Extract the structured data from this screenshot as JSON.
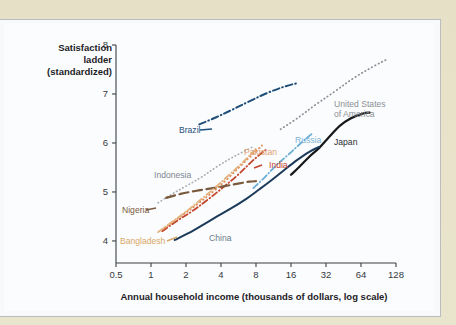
{
  "figure": {
    "background_color": "#fbfcfd",
    "paper_color": "#e9e4cc",
    "y_axis_label_lines": [
      "Satisfaction",
      "ladder",
      "(standardized)"
    ],
    "x_axis_title": "Annual household income (thousands of dollars, log scale)"
  },
  "chart_data": {
    "type": "line",
    "title": "",
    "subtitle": "",
    "xlabel": "Annual household income (thousands of dollars, log scale)",
    "ylabel": "Satisfaction ladder (standardized)",
    "x_scale": "log2",
    "x_ticks": [
      0.5,
      1,
      2,
      4,
      8,
      16,
      32,
      64,
      128
    ],
    "x_tick_labels": [
      "0.5",
      "1",
      "2",
      "4",
      "8",
      "16",
      "32",
      "64",
      "128"
    ],
    "y_ticks": [
      4,
      5,
      6,
      7,
      8
    ],
    "y_tick_labels": [
      "4",
      "5",
      "6",
      "7",
      "8"
    ],
    "xlim": [
      0.5,
      128
    ],
    "ylim": [
      3.55,
      8.0
    ],
    "grid": false,
    "legend": "inline-labels",
    "series": [
      {
        "name": "Brazil",
        "color": "#1f4e79",
        "dash": "dash-dot",
        "width": 2.0,
        "label_color": "#1f4e79",
        "label_x": 175,
        "label_y": 110,
        "label_anchor": "start",
        "points": [
          [
            2.6,
            6.38
          ],
          [
            3.6,
            6.52
          ],
          [
            5.0,
            6.68
          ],
          [
            7.0,
            6.85
          ],
          [
            10.0,
            7.02
          ],
          [
            14.0,
            7.15
          ],
          [
            18.0,
            7.22
          ]
        ]
      },
      {
        "name": "United States of America",
        "color": "#8d9096",
        "dash": "dotted",
        "width": 1.7,
        "label_color": "#8d9096",
        "label_x": 330,
        "label_y": 84,
        "label_anchor": "start",
        "points": [
          [
            13.0,
            6.28
          ],
          [
            18.0,
            6.5
          ],
          [
            26.0,
            6.78
          ],
          [
            38.0,
            7.05
          ],
          [
            55.0,
            7.32
          ],
          [
            80.0,
            7.55
          ],
          [
            110.0,
            7.72
          ]
        ]
      },
      {
        "name": "Japan",
        "color": "#16181a",
        "dash": "solid",
        "width": 2.2,
        "label_color": "#2a2d31",
        "label_x": 330,
        "label_y": 122,
        "label_anchor": "start",
        "points": [
          [
            16.0,
            5.35
          ],
          [
            19.0,
            5.52
          ],
          [
            23.0,
            5.72
          ],
          [
            28.0,
            5.9
          ],
          [
            34.0,
            6.12
          ],
          [
            42.0,
            6.35
          ],
          [
            52.0,
            6.5
          ],
          [
            66.0,
            6.6
          ],
          [
            76.0,
            6.62
          ]
        ]
      },
      {
        "name": "Russia",
        "color": "#6aaed6",
        "dash": "dash-dot",
        "width": 1.8,
        "label_color": "#7fb4d6",
        "label_x": 291,
        "label_y": 120,
        "label_anchor": "start",
        "points": [
          [
            7.6,
            5.08
          ],
          [
            9.5,
            5.3
          ],
          [
            12.0,
            5.55
          ],
          [
            15.5,
            5.78
          ],
          [
            19.5,
            6.0
          ],
          [
            24.0,
            6.18
          ]
        ]
      },
      {
        "name": "China",
        "color": "#1c3b5a",
        "dash": "solid",
        "width": 2.0,
        "label_color": "#6b7c8c",
        "label_x": 205,
        "label_y": 218,
        "label_anchor": "start",
        "points": [
          [
            1.6,
            4.02
          ],
          [
            2.1,
            4.16
          ],
          [
            2.8,
            4.33
          ],
          [
            3.7,
            4.5
          ],
          [
            5.0,
            4.68
          ],
          [
            6.6,
            4.86
          ],
          [
            8.5,
            5.05
          ],
          [
            11.0,
            5.25
          ],
          [
            14.0,
            5.45
          ],
          [
            18.0,
            5.65
          ],
          [
            23.0,
            5.82
          ],
          [
            28.0,
            5.92
          ]
        ]
      },
      {
        "name": "India",
        "color": "#c1452a",
        "dash": "dash-dot",
        "width": 1.8,
        "label_color": "#c1452a",
        "label_x": 265,
        "label_y": 145,
        "label_anchor": "start",
        "points": [
          [
            1.25,
            4.2
          ],
          [
            1.7,
            4.42
          ],
          [
            2.3,
            4.62
          ],
          [
            3.1,
            4.85
          ],
          [
            4.2,
            5.1
          ],
          [
            5.6,
            5.35
          ],
          [
            7.2,
            5.6
          ],
          [
            9.0,
            5.8
          ],
          [
            10.0,
            5.88
          ]
        ]
      },
      {
        "name": "Pakistan",
        "color": "#e08a52",
        "dash": "dotted",
        "width": 1.8,
        "label_color": "#e0a070",
        "label_x": 240,
        "label_y": 132,
        "label_anchor": "start",
        "points": [
          [
            1.3,
            4.26
          ],
          [
            1.8,
            4.5
          ],
          [
            2.5,
            4.75
          ],
          [
            3.4,
            5.0
          ],
          [
            4.6,
            5.28
          ],
          [
            6.0,
            5.55
          ],
          [
            7.6,
            5.78
          ],
          [
            9.0,
            5.95
          ]
        ]
      },
      {
        "name": "Indonesia",
        "color": "#a8abb0",
        "dash": "dotted",
        "width": 1.6,
        "label_color": "#7d8790",
        "label_x": 150,
        "label_y": 155,
        "label_anchor": "start",
        "points": [
          [
            1.15,
            4.78
          ],
          [
            1.5,
            4.95
          ],
          [
            2.0,
            5.12
          ],
          [
            2.7,
            5.3
          ],
          [
            3.6,
            5.5
          ],
          [
            4.8,
            5.68
          ],
          [
            6.2,
            5.82
          ],
          [
            7.5,
            5.92
          ]
        ]
      },
      {
        "name": "Nigeria",
        "color": "#7a5a3c",
        "dash": "long-dash",
        "width": 2.2,
        "label_color": "#7a5a3c",
        "label_x": 118,
        "label_y": 190,
        "label_anchor": "start",
        "points": [
          [
            1.35,
            4.88
          ],
          [
            1.8,
            4.96
          ],
          [
            2.4,
            5.02
          ],
          [
            3.2,
            5.07
          ],
          [
            4.3,
            5.12
          ],
          [
            5.6,
            5.17
          ],
          [
            7.0,
            5.21
          ],
          [
            8.0,
            5.22
          ]
        ]
      },
      {
        "name": "Bangladesh",
        "color": "#e2b07a",
        "dash": "dash-dot",
        "width": 1.8,
        "label_color": "#d9a868",
        "label_x": 116,
        "label_y": 221,
        "label_anchor": "start",
        "points": [
          [
            1.15,
            4.18
          ],
          [
            1.5,
            4.38
          ],
          [
            2.0,
            4.6
          ],
          [
            2.7,
            4.85
          ],
          [
            3.6,
            5.1
          ],
          [
            4.7,
            5.35
          ],
          [
            6.0,
            5.58
          ],
          [
            7.3,
            5.78
          ],
          [
            8.3,
            5.9
          ]
        ]
      }
    ]
  }
}
